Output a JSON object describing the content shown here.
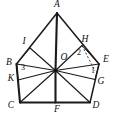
{
  "figure": {
    "stroke_color": "#1a1a1a",
    "background_color": "#ffffff",
    "width": 117,
    "height": 125,
    "vertex_labels": [
      {
        "id": "A",
        "text": "A",
        "x": 57,
        "y": 5,
        "role": "pentagon-vertex-top"
      },
      {
        "id": "B",
        "text": "B",
        "x": 9,
        "y": 63,
        "role": "pentagon-vertex-left"
      },
      {
        "id": "C",
        "text": "C",
        "x": 11,
        "y": 106,
        "role": "pentagon-vertex-bottom-left"
      },
      {
        "id": "D",
        "text": "D",
        "x": 96,
        "y": 106,
        "role": "pentagon-vertex-bottom-right"
      },
      {
        "id": "E",
        "text": "E",
        "x": 106,
        "y": 60,
        "role": "pentagon-vertex-right"
      },
      {
        "id": "F",
        "text": "F",
        "x": 57,
        "y": 110,
        "role": "point-on-side-CD"
      },
      {
        "id": "G",
        "text": "G",
        "x": 101,
        "y": 82,
        "role": "point-on-side-DE"
      },
      {
        "id": "H",
        "text": "H",
        "x": 85,
        "y": 40,
        "role": "point-on-side-AE"
      },
      {
        "id": "I",
        "text": "I",
        "x": 24,
        "y": 42,
        "role": "point-on-side-AB"
      },
      {
        "id": "K",
        "text": "K",
        "x": 11,
        "y": 79,
        "role": "point-on-side-BC"
      },
      {
        "id": "O",
        "text": "O",
        "x": 64,
        "y": 58,
        "role": "center-point"
      }
    ],
    "angle_labels": [
      {
        "id": "1",
        "text": "1",
        "x": 93,
        "y": 71,
        "role": "angle-at-E"
      },
      {
        "id": "2",
        "text": "2",
        "x": 79,
        "y": 53,
        "role": "angle-at-H"
      },
      {
        "id": "3",
        "text": "3",
        "x": 23,
        "y": 68,
        "role": "angle-at-B"
      }
    ],
    "points": {
      "A": {
        "x": 57,
        "y": 13
      },
      "B": {
        "x": 16.5,
        "y": 64
      },
      "C": {
        "x": 20,
        "y": 102.5
      },
      "D": {
        "x": 90,
        "y": 102.5
      },
      "E": {
        "x": 99,
        "y": 64
      },
      "F": {
        "x": 55.5,
        "y": 102.5
      },
      "G": {
        "x": 95,
        "y": 79.5
      },
      "H": {
        "x": 82,
        "y": 45.5
      },
      "I": {
        "x": 30,
        "y": 48
      },
      "K": {
        "x": 18,
        "y": 80
      },
      "O": {
        "x": 55.5,
        "y": 70.5
      }
    },
    "outer_edges": [
      {
        "from": "A",
        "to": "B",
        "name": "side-AB"
      },
      {
        "from": "B",
        "to": "C",
        "name": "side-BC"
      },
      {
        "from": "C",
        "to": "D",
        "name": "side-CD"
      },
      {
        "from": "D",
        "to": "E",
        "name": "side-DE"
      },
      {
        "from": "E",
        "to": "A",
        "name": "side-EA"
      }
    ],
    "spokes": [
      {
        "from": "O",
        "to": "A",
        "name": "segment-OA"
      },
      {
        "from": "O",
        "to": "B",
        "name": "segment-OB"
      },
      {
        "from": "O",
        "to": "C",
        "name": "segment-OC"
      },
      {
        "from": "O",
        "to": "D",
        "name": "segment-OD"
      },
      {
        "from": "O",
        "to": "E",
        "name": "segment-OE"
      },
      {
        "from": "O",
        "to": "F",
        "name": "segment-OF"
      },
      {
        "from": "O",
        "to": "G",
        "name": "segment-OG"
      },
      {
        "from": "O",
        "to": "H",
        "name": "segment-OH"
      },
      {
        "from": "O",
        "to": "I",
        "name": "segment-OI"
      },
      {
        "from": "O",
        "to": "K",
        "name": "segment-OK"
      }
    ],
    "dashed_segments": [
      {
        "from": "H",
        "to": {
          "x": 95,
          "y": 71
        },
        "name": "dashed-segment-H-to-E-foot"
      }
    ]
  }
}
